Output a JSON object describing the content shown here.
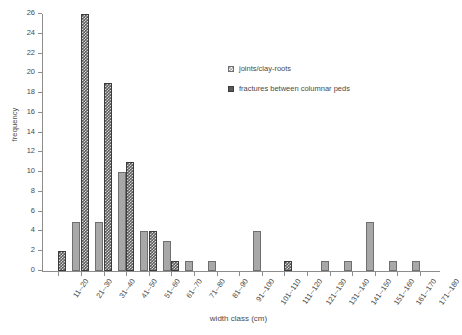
{
  "chart_data": {
    "type": "bar",
    "title": "",
    "xlabel": "width class (cm)",
    "ylabel": "frequency",
    "ylim": [
      0,
      26
    ],
    "ytick_step": 2,
    "yticks": [
      0,
      2,
      4,
      6,
      8,
      10,
      12,
      14,
      16,
      18,
      20,
      22,
      24,
      26
    ],
    "grid": false,
    "legend_position": "upper-center-right",
    "categories": [
      "11--20",
      "21--30",
      "31--40",
      "41--50",
      "51--60",
      "61--70",
      "71--80",
      "81--90",
      "91--100",
      "101--110",
      "111--120",
      "121--130",
      "131--140",
      "141--150",
      "151--160",
      "161--170",
      "171--180"
    ],
    "series": [
      {
        "name": "joints/clay-roots",
        "color": "#a8a8a8",
        "values": [
          0,
          5,
          5,
          10,
          4,
          3,
          1,
          1,
          0,
          4,
          0,
          0,
          1,
          1,
          5,
          1,
          1
        ]
      },
      {
        "name": "fractures between columnar peds",
        "color": "#5a5a5a",
        "values": [
          2,
          26,
          19,
          11,
          4,
          1,
          0,
          0,
          0,
          0,
          1,
          0,
          0,
          0,
          0,
          0,
          0
        ]
      }
    ]
  },
  "legend": {
    "items": [
      {
        "label": "joints/clay-roots"
      },
      {
        "label": "fractures between columnar peds"
      }
    ]
  },
  "axes": {
    "y_title": "frequency",
    "x_title": "width class (cm)"
  }
}
